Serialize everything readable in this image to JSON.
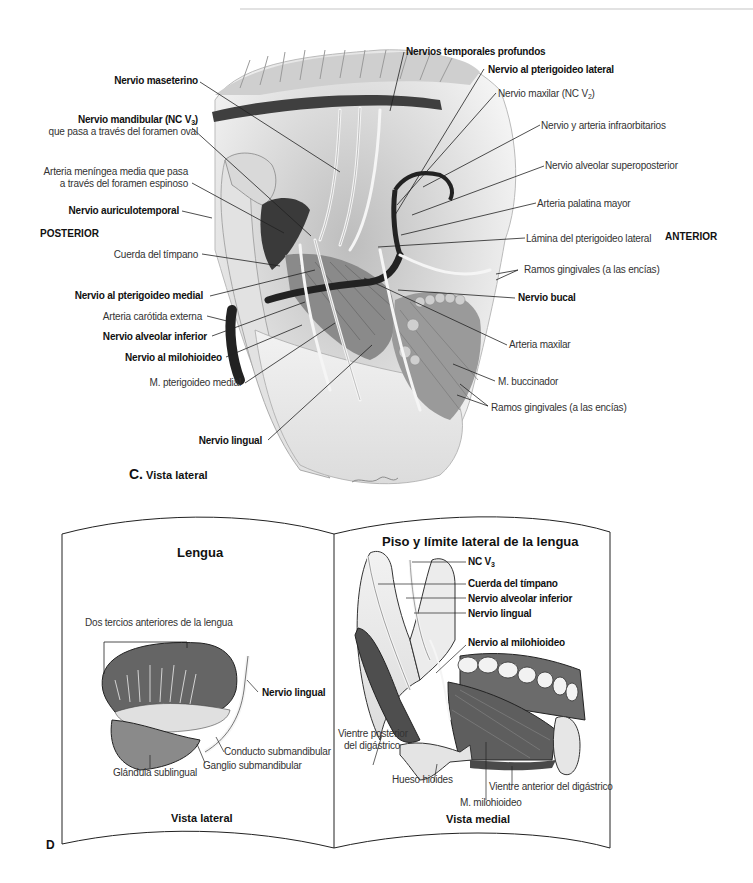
{
  "figure_c": {
    "caption_letter": "C.",
    "caption_text": "Vista lateral",
    "orientation": {
      "posterior": "POSTERIOR",
      "anterior": "ANTERIOR"
    },
    "labels_left": [
      {
        "text": "Nervio maseterino",
        "bold": true
      },
      {
        "text": "Nervio mandibular (NC V",
        "sub": "3",
        "after": ")",
        "bold": true,
        "line2": "que pasa a través del foramen oval"
      },
      {
        "text": "Arteria meníngea media que pasa",
        "bold": false,
        "line2": "a través del foramen espinoso"
      },
      {
        "text": "Nervio auriculotemporal",
        "bold": true
      },
      {
        "text": "Cuerda del tímpano",
        "bold": false
      },
      {
        "text": "Nervio al pterigoideo medial",
        "bold": true
      },
      {
        "text": "Arteria carótida externa",
        "bold": false
      },
      {
        "text": "Nervio alveolar inferior",
        "bold": true
      },
      {
        "text": "Nervio al milohioideo",
        "bold": true
      },
      {
        "text": "M. pterigoideo medial",
        "bold": false
      },
      {
        "text": "Nervio lingual",
        "bold": true
      }
    ],
    "labels_right": [
      {
        "text": "Nervios temporales profundos",
        "bold": true
      },
      {
        "text": "Nervio al pterigoideo lateral",
        "bold": true
      },
      {
        "text": "Nervio maxilar (NC V",
        "sub": "2",
        "after": ")",
        "bold": false
      },
      {
        "text": "Nervio y arteria infraorbitarios",
        "bold": false
      },
      {
        "text": "Nervio alveolar superoposterior",
        "bold": false
      },
      {
        "text": "Arteria palatina mayor",
        "bold": false
      },
      {
        "text": "Lámina del pterigoideo lateral",
        "bold": false
      },
      {
        "text": "Ramos gingivales (a las encías)",
        "bold": false
      },
      {
        "text": "Nervio bucal",
        "bold": true
      },
      {
        "text": "Arteria maxilar",
        "bold": false
      },
      {
        "text": "M. buccinador",
        "bold": false
      },
      {
        "text": "Ramos gingivales (a las encías)",
        "bold": false
      }
    ]
  },
  "figure_d": {
    "panel_letter": "D",
    "left_page": {
      "title": "Lengua",
      "bracket_label": "Dos tercios anteriores de la lengua",
      "labels": [
        {
          "text": "Nervio lingual",
          "bold": true
        },
        {
          "text": "Conducto submandibular",
          "bold": false
        },
        {
          "text": "Ganglio submandibular",
          "bold": false
        },
        {
          "text": "Glándula sublingual",
          "bold": false
        }
      ],
      "caption": "Vista lateral"
    },
    "right_page": {
      "title": "Piso y límite lateral de la lengua",
      "labels": [
        {
          "text": "NC V",
          "sub": "3",
          "bold": true
        },
        {
          "text": "Cuerda del tímpano",
          "bold": true
        },
        {
          "text": "Nervio alveolar inferior",
          "bold": true
        },
        {
          "text": "Nervio lingual",
          "bold": true
        },
        {
          "text": "Nervio al milohioideo",
          "bold": true
        },
        {
          "text": "Vientre posterior",
          "bold": false,
          "line2": "del digástrico"
        },
        {
          "text": "Hueso hioides",
          "bold": false
        },
        {
          "text": "Vientre anterior del digástrico",
          "bold": false
        },
        {
          "text": "M. milohioideo",
          "bold": false
        }
      ],
      "caption": "Vista medial"
    }
  },
  "colors": {
    "leader_line": "#222222",
    "tongue_fill": "#6a6a6a",
    "bone_fill": "#e6e6e6",
    "muscle_dark": "#555555",
    "artery_dark": "#2a2a2a"
  }
}
